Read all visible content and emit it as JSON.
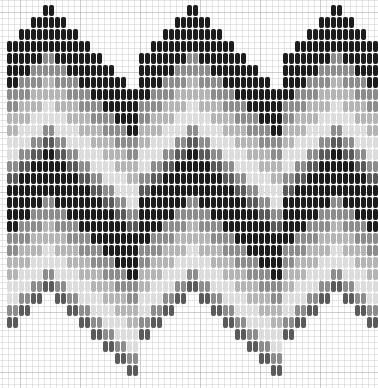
{
  "grid": {
    "minor_spacing_px": 6,
    "major_spacing_px": 60
  },
  "colors": {
    "black": "#1c1c1c",
    "dark_gray": "#5a5a5a",
    "mid_gray": "#8c8c8c",
    "light_gray": "#b4b4b4",
    "very_light": "#dcdcdc"
  },
  "layout": {
    "first_column_x": 9,
    "column_pitch_px": 6,
    "stitch_height_px": 12,
    "stitch_gap_px": 1,
    "stitches_per_column": 24
  },
  "column_pair_tops": [
    41,
    29,
    17,
    5,
    17,
    29,
    41,
    53,
    65,
    77,
    89,
    53,
    41,
    29,
    17,
    5,
    17,
    29,
    41,
    53,
    65,
    77,
    89,
    53,
    41,
    29,
    17,
    5,
    17,
    29,
    41
  ],
  "color_sequence": [
    "black",
    "black",
    "black",
    "black",
    "mid_gray",
    "mid_gray",
    "light_gray",
    "light_gray",
    "very_light",
    "very_light",
    "mid_gray",
    "dark_gray",
    "black",
    "black",
    "black",
    "black",
    "mid_gray",
    "mid_gray",
    "light_gray",
    "light_gray",
    "very_light",
    "very_light",
    "mid_gray",
    "dark_gray"
  ]
}
